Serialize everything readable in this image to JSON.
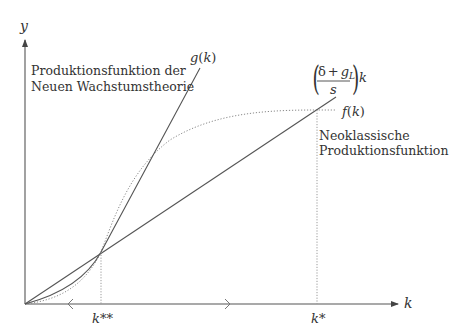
{
  "diagram": {
    "axes": {
      "y_label": "y",
      "x_label": "k"
    },
    "curves": {
      "g": {
        "label_fn": "g",
        "label_arg": "k",
        "style": "solid"
      },
      "investment_line": {
        "numerator_delta": "δ",
        "numerator_plus": "+",
        "numerator_g": "g",
        "numerator_sub": "L",
        "denominator": "s",
        "suffix": "k",
        "style": "solid"
      },
      "f": {
        "label_fn": "f",
        "label_arg": "k",
        "style": "dotted"
      }
    },
    "annotations": {
      "new_growth_line1": "Produktionsfunktion der",
      "new_growth_line2": "Neuen Wachstumstheorie",
      "neoclassical_line1": "Neoklassische",
      "neoclassical_line2": "Produktionsfunktion"
    },
    "steady_states": {
      "k_double_star": "k**",
      "k_star": "k*"
    },
    "colors": {
      "line": "#555555",
      "dotted": "#8a8a8a",
      "text": "#333333",
      "background": "#ffffff"
    }
  }
}
